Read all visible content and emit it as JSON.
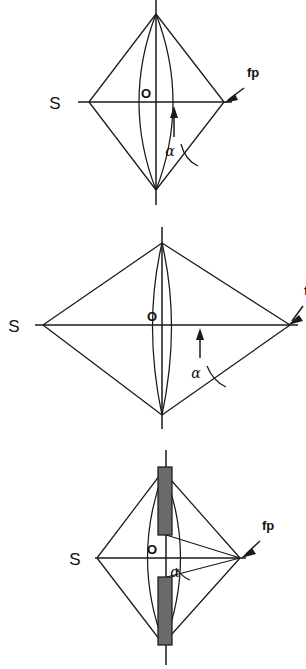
{
  "figure": {
    "panel_count": 3,
    "background_color": "#ffffff",
    "line_color": "#1a1a1a",
    "bar_fill_color": "#6a6a6a"
  },
  "labels": {
    "source": "S",
    "center": "O",
    "focal_point": "fp",
    "angle": "α"
  },
  "panels": [
    {
      "id": "panel-1",
      "name": "moderate-aperture-panel",
      "source_label": "S",
      "center_label": "O",
      "focal_point_label": "fp",
      "angle_label": "α",
      "has_aperture_stop": false,
      "focal_point_label_visible": true
    },
    {
      "id": "panel-2",
      "name": "wide-aperture-panel",
      "source_label": "S",
      "center_label": "O",
      "focal_point_label": "f",
      "angle_label": "α",
      "has_aperture_stop": false,
      "focal_point_label_visible": true
    },
    {
      "id": "panel-3",
      "name": "stopped-down-aperture-panel",
      "source_label": "S",
      "center_label": "O",
      "focal_point_label": "fp",
      "angle_label": "α",
      "has_aperture_stop": true,
      "focal_point_label_visible": true
    }
  ]
}
